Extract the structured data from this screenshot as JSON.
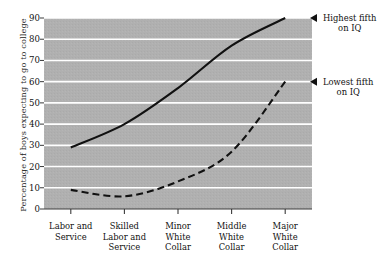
{
  "chart_data": {
    "type": "line",
    "title": "",
    "subtitle": "",
    "xlabel": "",
    "ylabel": "Percentage of boys expecting to go to college",
    "categories": [
      "Labor and Service",
      "Skilled Labor and Service",
      "Minor White Collar",
      "Middle White Collar",
      "Major White Collar"
    ],
    "category_lines": [
      [
        "Labor and",
        "Service"
      ],
      [
        "Skilled",
        "Labor and",
        "Service"
      ],
      [
        "Minor",
        "White",
        "Collar"
      ],
      [
        "Middle",
        "White",
        "Collar"
      ],
      [
        "Major",
        "White",
        "Collar"
      ]
    ],
    "ylim": [
      0,
      90
    ],
    "yticks": [
      0,
      10,
      20,
      30,
      40,
      50,
      60,
      70,
      80,
      90
    ],
    "ytick_labels": [
      "0",
      "10",
      "20",
      "30",
      "40",
      "50",
      "60",
      "70",
      "80",
      "90"
    ],
    "grid": true,
    "grid_color": "#ffffff",
    "plot_background": "#b0b0b0",
    "legend_position": "right-annotations",
    "series": [
      {
        "name": "Highest fifth on IQ",
        "style": "solid",
        "color": "#111111",
        "values": [
          29,
          40,
          57,
          77,
          90
        ],
        "annotation_lines": [
          "Highest fifth",
          "on IQ"
        ]
      },
      {
        "name": "Lowest fifth on IQ",
        "style": "dashed",
        "color": "#111111",
        "values": [
          9,
          6,
          13,
          27,
          60
        ],
        "annotation_lines": [
          "Lowest fifth",
          "on IQ"
        ]
      }
    ]
  }
}
